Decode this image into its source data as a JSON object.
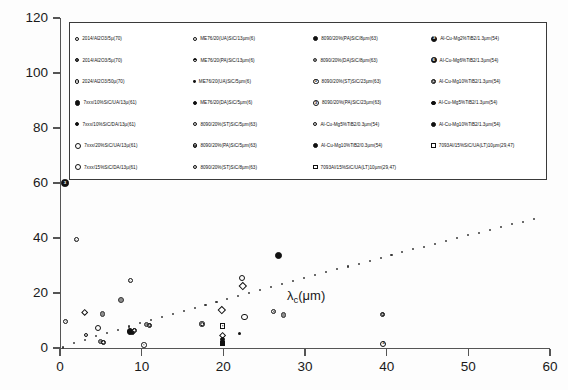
{
  "axes": {
    "y_title": "COD (σ) m",
    "y_ticks": [
      "0",
      "20",
      "40",
      "60",
      "80",
      "100",
      "120"
    ],
    "x_ticks": [
      "0",
      "10",
      "20",
      "30",
      "40",
      "50",
      "60"
    ],
    "x_inline_label": "λ",
    "x_inline_sub": "c",
    "x_inline_unit": "(μm)",
    "ylim": [
      0,
      120
    ],
    "xlim": [
      0,
      60
    ]
  },
  "legend": {
    "entries": [
      {
        "marker": "open",
        "size": 4.2,
        "label": "2014/Al2O3/5µ(70)"
      },
      {
        "marker": "dbl",
        "size": 4.4,
        "label": "2014/Al2O3/5µ(70)"
      },
      {
        "marker": "dot",
        "size": 4.2,
        "label": "2024/Al2O3/50µ(70)"
      },
      {
        "marker": "fill",
        "size": 5.4,
        "label": "7xxx/10%SiC/UA/13µ(61)"
      },
      {
        "marker": "fill",
        "size": 4.4,
        "label": "7xxx/10%SiC/DA/13µ(61)"
      },
      {
        "marker": "ring",
        "size": 6.2,
        "label": "7xxx/20%SiC/UA/13µ(61)"
      },
      {
        "marker": "ring",
        "size": 6.0,
        "label": "7xxx/15%SiC/DA/13µ(61)"
      },
      {
        "marker": "open",
        "size": 4.2,
        "label": "ME76/20(UA)SiC/13µm(6)"
      },
      {
        "marker": "halfv",
        "size": 4.4,
        "label": "ME76/20(PA)SiC/13µm(6)"
      },
      {
        "marker": "tiny",
        "size": 2.8,
        "label": "ME76/20(UA)SiC/5µm(6)"
      },
      {
        "marker": "fill",
        "size": 4.2,
        "label": "ME76/20(DA)SiC/5µm(6)"
      },
      {
        "marker": "dot",
        "size": 4.4,
        "label": "8090/20%(ST)SiC/5µm(63)"
      },
      {
        "marker": "dbl",
        "size": 4.4,
        "label": "8090/20%(PA)SiC/5µm(63)"
      },
      {
        "marker": "dot",
        "size": 4.4,
        "label": "8090/20%(ST)SiC/8µm(63)"
      },
      {
        "marker": "fill",
        "size": 5.2,
        "label": "8090/20%(PA)SiC/8µm(63)"
      },
      {
        "marker": "grey",
        "size": 4.4,
        "label": "8090/20%(DA)SiC/8µm(63)"
      },
      {
        "marker": "num",
        "size": 5.6,
        "glyph": "3",
        "label": "8090/20%(ST)SiC/23µm(63)"
      },
      {
        "marker": "num",
        "size": 6.0,
        "glyph": "3",
        "label": "8090/20%(PA)SiC/23µm(63)"
      },
      {
        "marker": "dot",
        "size": 4.4,
        "label": "Al-Cu-Mg5%TiB2/0.3µm(54)"
      },
      {
        "marker": "fill",
        "size": 5.0,
        "label": "Al-Cu-Mg10%TiB2/0.3µm(54)"
      },
      {
        "marker": "sqopen",
        "size": 4.6,
        "label": "7093Al/15%SiC/UA(LT)10µm(29,47)"
      },
      {
        "marker": "numinv",
        "size": 6.2,
        "glyph": "3",
        "label": "Al-Cu-Mg2%TiB2/1.3µm(54)"
      },
      {
        "marker": "numinv",
        "size": 5.6,
        "glyph": "6",
        "label": "Al-Cu-Mg6%TiB2/1.3µm(54)"
      },
      {
        "marker": "dbl",
        "size": 5.0,
        "label": "Al-Cu-Mg10%TiB2/1.3µm(54)"
      },
      {
        "marker": "fill",
        "size": 4.6,
        "label": "Al-Cu-Mg5%TiB2/1.3µm(54)"
      },
      {
        "marker": "fill",
        "size": 5.0,
        "label": "Al-Cu-Mg10%TiB2/1.3µm(54)"
      },
      {
        "marker": "sqopen",
        "size": 4.8,
        "label": "7093Al/15%SiC/UA(LT)10µm(29,47)"
      },
      {
        "marker": "none",
        "size": 0,
        "label": ""
      },
      {
        "marker": "sq",
        "size": 4.6,
        "label": "7093Al/15%SiC/PA(LT)10µm(29,47)"
      },
      {
        "marker": "sq",
        "size": 3.6,
        "label": "7093Al/15%SiC/DA1(LT)10µm(29,47)"
      },
      {
        "marker": "sqx",
        "size": 5.0,
        "label": "7093Al/15%SiC/DA2(LT)10µm(29,47)"
      },
      {
        "marker": "dia",
        "size": 5.0,
        "label": "7093Al/15%SiC/DA3(LT)10µm(29,47)"
      },
      {
        "marker": "dia",
        "size": 4.6,
        "label": "7093Al/15%SiC/ST(1%dd.LT)10µm(29,47)"
      },
      {
        "marker": "tiny",
        "size": 2.6,
        "label": "Rice & Johnson model"
      },
      {
        "marker": "none",
        "size": 0,
        "label": ""
      }
    ]
  },
  "chart_data": {
    "type": "scatter",
    "title": "",
    "xlabel": "λc(μm)",
    "ylabel": "COD (σ) m",
    "xlim": [
      0,
      60
    ],
    "ylim": [
      0,
      120
    ],
    "grid": false,
    "legend_position": "top",
    "points": [
      {
        "x": 0.6,
        "y": 60.0,
        "marker": "numinv",
        "size": 7.5,
        "glyph": "3"
      },
      {
        "x": 2.0,
        "y": 39.4,
        "marker": "dot",
        "size": 5.0
      },
      {
        "x": 0.7,
        "y": 9.7,
        "marker": "dot",
        "size": 5.0
      },
      {
        "x": 3.0,
        "y": 12.7,
        "marker": "dia",
        "size": 5.4
      },
      {
        "x": 3.2,
        "y": 4.8,
        "marker": "dot",
        "size": 4.6
      },
      {
        "x": 4.6,
        "y": 7.4,
        "marker": "ring",
        "size": 6.0
      },
      {
        "x": 5.2,
        "y": 12.3,
        "marker": "grey",
        "size": 5.4
      },
      {
        "x": 5.0,
        "y": 2.3,
        "marker": "grey",
        "size": 5.2
      },
      {
        "x": 5.3,
        "y": 2.0,
        "marker": "dbl",
        "size": 5.2
      },
      {
        "x": 7.5,
        "y": 17.5,
        "marker": "grey",
        "size": 6.2
      },
      {
        "x": 8.6,
        "y": 24.4,
        "marker": "dot",
        "size": 5.0
      },
      {
        "x": 8.6,
        "y": 6.0,
        "marker": "fill",
        "size": 6.4
      },
      {
        "x": 8.9,
        "y": 5.6,
        "marker": "fill",
        "size": 5.6
      },
      {
        "x": 9.1,
        "y": 6.4,
        "marker": "dbl",
        "size": 5.2
      },
      {
        "x": 10.3,
        "y": 1.1,
        "marker": "dot",
        "size": 5.4
      },
      {
        "x": 10.6,
        "y": 8.4,
        "marker": "grey",
        "size": 5.0
      },
      {
        "x": 11.0,
        "y": 8.2,
        "marker": "dbl",
        "size": 5.2
      },
      {
        "x": 17.4,
        "y": 8.7,
        "marker": "dbl",
        "size": 5.4
      },
      {
        "x": 19.8,
        "y": 14.0,
        "marker": "dia",
        "size": 5.6
      },
      {
        "x": 19.9,
        "y": 8.0,
        "marker": "sqx",
        "size": 5.6
      },
      {
        "x": 19.9,
        "y": 4.5,
        "marker": "dia",
        "size": 5.2
      },
      {
        "x": 19.9,
        "y": 3.2,
        "marker": "fill",
        "size": 5.0
      },
      {
        "x": 19.9,
        "y": 1.6,
        "marker": "sq",
        "size": 5.2
      },
      {
        "x": 22.3,
        "y": 25.4,
        "marker": "ring",
        "size": 6.6
      },
      {
        "x": 22.4,
        "y": 22.6,
        "marker": "dia",
        "size": 5.6
      },
      {
        "x": 22.6,
        "y": 11.2,
        "marker": "ring",
        "size": 6.2
      },
      {
        "x": 26.8,
        "y": 33.5,
        "marker": "fill",
        "size": 7.0
      },
      {
        "x": 26.2,
        "y": 13.3,
        "marker": "dot",
        "size": 5.0
      },
      {
        "x": 27.4,
        "y": 12.0,
        "marker": "grey",
        "size": 5.2
      },
      {
        "x": 39.5,
        "y": 12.2,
        "marker": "dbl",
        "size": 5.0
      },
      {
        "x": 39.6,
        "y": 1.6,
        "marker": "num",
        "size": 6.2,
        "glyph": "3"
      },
      {
        "x": 22.0,
        "y": 5.4,
        "marker": "tiny",
        "size": 3.0
      }
    ],
    "model_curve": {
      "name": "Rice & Johnson model",
      "style": "dotted",
      "x_start": 0.4,
      "x_end": 58.0,
      "y_start": 0.2,
      "y_end": 47.0,
      "n_dots": 44
    }
  }
}
